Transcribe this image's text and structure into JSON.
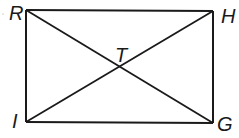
{
  "diagram": {
    "type": "rectangle-with-diagonals",
    "stroke_color": "#1a1a1a",
    "background": "#ffffff",
    "vertices": [
      {
        "name": "R",
        "x": 26,
        "y": 10
      },
      {
        "name": "H",
        "x": 213,
        "y": 11
      },
      {
        "name": "G",
        "x": 213,
        "y": 123
      },
      {
        "name": "I",
        "x": 26,
        "y": 122
      }
    ],
    "intersection": {
      "name": "T",
      "x": 120,
      "y": 67
    },
    "labels": {
      "R": "R",
      "H": "H",
      "G": "G",
      "I": "I",
      "T": "T"
    },
    "segments": [
      "RH",
      "HG",
      "GI",
      "IR",
      "RG",
      "IH"
    ]
  }
}
